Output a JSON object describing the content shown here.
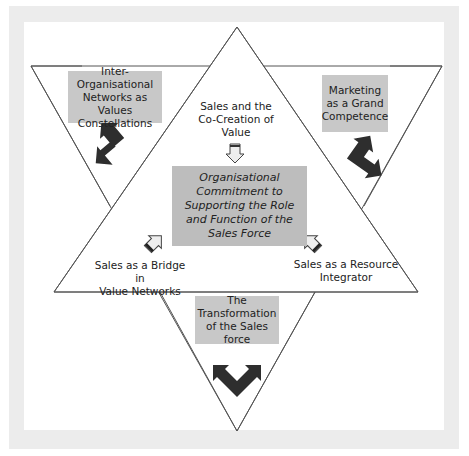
{
  "colors": {
    "frame": "#ececec",
    "panel": "#ffffff",
    "box_fill": "#c8c8c8",
    "center_box_fill": "#bdbdbd",
    "line": "#555555",
    "big_arrow": "#2e2e2e",
    "small_arrow_fill": "#e8e8e8"
  },
  "center": {
    "text": "Organisational Commitment to Supporting the Role and Function of the Sales Force",
    "lines": [
      "Organisational",
      "Commitment to",
      "Supporting the Role",
      "and Function of the",
      "Sales Force"
    ]
  },
  "inner_labels": {
    "top": {
      "lines": [
        "Sales and the",
        "Co-Creation of",
        "Value"
      ]
    },
    "left": {
      "lines": [
        "Sales as a Bridge in",
        "Value Networks"
      ]
    },
    "right": {
      "lines": [
        "Sales as a Resource",
        "Integrator"
      ]
    }
  },
  "outer_boxes": {
    "top_left": {
      "lines": [
        "Inter-",
        "Organisational",
        "Networks as Values",
        "Constellations"
      ]
    },
    "top_right": {
      "lines": [
        "Marketing",
        "as a Grand",
        "Competence"
      ]
    },
    "bottom": {
      "lines": [
        "The",
        "Transformation",
        "of the Sales force"
      ]
    }
  },
  "icons": {
    "small_arrows": [
      "down-arrow-icon",
      "up-right-arrow-icon",
      "up-left-arrow-icon"
    ],
    "big_arrows": [
      "double-headed-arrow-icon",
      "double-headed-arrow-icon",
      "double-headed-arrow-icon"
    ]
  }
}
